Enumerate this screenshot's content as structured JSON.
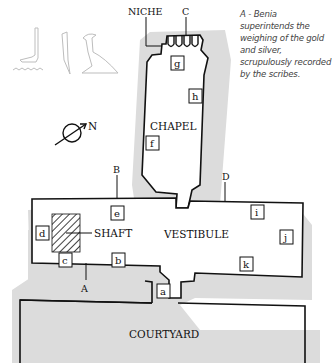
{
  "caption": "A - Benia superintends the weighing of the gold and silver, scrupulously recorded by the scribes.",
  "rooms": {
    "chapel": "CHAPEL",
    "vestibule": "VESTIBULE",
    "courtyard": "COURTYARD",
    "shaft": "SHAFT",
    "niche": "NICHE"
  },
  "wall_markers": [
    "A",
    "B",
    "C",
    "D"
  ],
  "compass": {
    "label": "N",
    "icon": "north-arrow-icon"
  },
  "scene_boxes": [
    {
      "id": "a"
    },
    {
      "id": "b"
    },
    {
      "id": "c"
    },
    {
      "id": "d"
    },
    {
      "id": "e"
    },
    {
      "id": "f"
    },
    {
      "id": "g"
    },
    {
      "id": "h"
    },
    {
      "id": "i"
    },
    {
      "id": "j"
    },
    {
      "id": "k"
    }
  ],
  "hieroglyphs": [
    "water-ripple-glyph",
    "foot-glyph",
    "reed-leaf-glyph",
    "vulture-glyph"
  ],
  "colors": {
    "wall_line": "#111111",
    "shadow": "#d9d9d9",
    "hieroglyph": "#bbbbbb"
  }
}
